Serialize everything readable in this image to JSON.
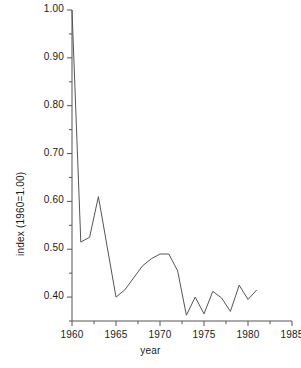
{
  "chart_data": {
    "type": "line",
    "title": "",
    "xlabel": "year",
    "ylabel": "index (1960=1.00)",
    "xlim": [
      1960,
      1985
    ],
    "ylim": [
      0.35,
      1.0
    ],
    "grid": false,
    "legend": null,
    "x_ticks": [
      1960,
      1965,
      1970,
      1975,
      1980,
      1985
    ],
    "x_tick_labels": [
      "1960",
      "1965",
      "1970",
      "1975",
      "1980",
      "1985"
    ],
    "x_minor_step": 2.5,
    "y_ticks": [
      0.4,
      0.5,
      0.6,
      0.7,
      0.8,
      0.9,
      1.0
    ],
    "y_tick_labels": [
      "0.40",
      "0.50",
      "0.60",
      "0.70",
      "0.80",
      "0.90",
      "1.00"
    ],
    "y_minor_step": 0.05,
    "series": [
      {
        "name": "index",
        "color": "#555555",
        "x": [
          1960,
          1961,
          1962,
          1963,
          1964,
          1965,
          1966,
          1967,
          1968,
          1969,
          1970,
          1971,
          1972,
          1973,
          1974,
          1975,
          1976,
          1977,
          1978,
          1979,
          1980,
          1981
        ],
        "values": [
          1.0,
          0.515,
          0.525,
          0.61,
          0.505,
          0.4,
          0.415,
          0.44,
          0.465,
          0.48,
          0.49,
          0.49,
          0.455,
          0.362,
          0.4,
          0.365,
          0.412,
          0.398,
          0.37,
          0.425,
          0.395,
          0.415
        ]
      }
    ]
  },
  "axes": {
    "x_label": "year",
    "y_label": "index (1960=1.00)"
  }
}
